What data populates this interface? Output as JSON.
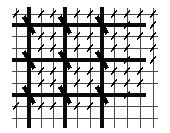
{
  "figure": {
    "width": 170,
    "height": 133,
    "background_color": "#ffffff",
    "thin_line_color": "#4a4a4a",
    "thick_line_color": "#0a0a0a",
    "marker_color": "#000000",
    "thin_line_width": 1,
    "thick_line_width": 3.2,
    "large_marker_width": 4.2,
    "small_marker_width": 1.6
  },
  "chart_data": {
    "type": "scatter",
    "title": "",
    "xlabel": "",
    "ylabel": "",
    "xlim": [
      0,
      170
    ],
    "ylim": [
      0,
      133
    ],
    "grid": true,
    "legend": null,
    "vertical_lines": [
      {
        "x": 16,
        "weight": "thin",
        "y0": 8,
        "y1": 128
      },
      {
        "x": 29,
        "weight": "thick",
        "y0": 7,
        "y1": 128
      },
      {
        "x": 41,
        "weight": "thin",
        "y0": 8,
        "y1": 128
      },
      {
        "x": 53,
        "weight": "thin",
        "y0": 8,
        "y1": 128
      },
      {
        "x": 65,
        "weight": "thick",
        "y0": 7,
        "y1": 128
      },
      {
        "x": 77,
        "weight": "thin",
        "y0": 8,
        "y1": 128
      },
      {
        "x": 90,
        "weight": "thin",
        "y0": 8,
        "y1": 128
      },
      {
        "x": 102,
        "weight": "thick",
        "y0": 7,
        "y1": 128
      },
      {
        "x": 114,
        "weight": "thin",
        "y0": 8,
        "y1": 128
      },
      {
        "x": 127,
        "weight": "thin",
        "y0": 8,
        "y1": 128
      },
      {
        "x": 140,
        "weight": "thin",
        "y0": 8,
        "y1": 128
      },
      {
        "x": 153,
        "weight": "thin",
        "y0": 8,
        "y1": 128
      }
    ],
    "horizontal_lines": [
      {
        "y": 14,
        "weight": "thin",
        "x0": 12,
        "x1": 158
      },
      {
        "y": 25,
        "weight": "thick",
        "x0": 12,
        "x1": 146
      },
      {
        "y": 36,
        "weight": "thin",
        "x0": 12,
        "x1": 158
      },
      {
        "y": 48,
        "weight": "thin",
        "x0": 12,
        "x1": 158
      },
      {
        "y": 60,
        "weight": "thick",
        "x0": 12,
        "x1": 146
      },
      {
        "y": 71,
        "weight": "thin",
        "x0": 12,
        "x1": 158
      },
      {
        "y": 83,
        "weight": "thin",
        "x0": 12,
        "x1": 158
      },
      {
        "y": 95,
        "weight": "thick",
        "x0": 12,
        "x1": 146
      },
      {
        "y": 106,
        "weight": "thin",
        "x0": 12,
        "x1": 158
      },
      {
        "y": 118,
        "weight": "thin",
        "x0": 12,
        "x1": 158
      }
    ],
    "large_markers": [
      {
        "x": 29,
        "y": 25
      },
      {
        "x": 65,
        "y": 25
      },
      {
        "x": 102,
        "y": 25
      },
      {
        "x": 29,
        "y": 60
      },
      {
        "x": 65,
        "y": 60
      },
      {
        "x": 102,
        "y": 60
      },
      {
        "x": 29,
        "y": 95
      },
      {
        "x": 65,
        "y": 95
      },
      {
        "x": 102,
        "y": 95
      }
    ],
    "small_markers": [
      {
        "x": 16,
        "y": 14
      },
      {
        "x": 41,
        "y": 14
      },
      {
        "x": 53,
        "y": 14
      },
      {
        "x": 77,
        "y": 14
      },
      {
        "x": 90,
        "y": 14
      },
      {
        "x": 114,
        "y": 14
      },
      {
        "x": 127,
        "y": 14
      },
      {
        "x": 140,
        "y": 14
      },
      {
        "x": 153,
        "y": 14
      },
      {
        "x": 127,
        "y": 25
      },
      {
        "x": 153,
        "y": 25
      },
      {
        "x": 41,
        "y": 36
      },
      {
        "x": 53,
        "y": 36
      },
      {
        "x": 77,
        "y": 36
      },
      {
        "x": 90,
        "y": 36
      },
      {
        "x": 114,
        "y": 36
      },
      {
        "x": 127,
        "y": 36
      },
      {
        "x": 140,
        "y": 36
      },
      {
        "x": 153,
        "y": 36
      },
      {
        "x": 41,
        "y": 48
      },
      {
        "x": 53,
        "y": 48
      },
      {
        "x": 77,
        "y": 48
      },
      {
        "x": 90,
        "y": 48
      },
      {
        "x": 114,
        "y": 48
      },
      {
        "x": 127,
        "y": 48
      },
      {
        "x": 153,
        "y": 48
      },
      {
        "x": 127,
        "y": 60
      },
      {
        "x": 153,
        "y": 60
      },
      {
        "x": 41,
        "y": 71
      },
      {
        "x": 53,
        "y": 71
      },
      {
        "x": 77,
        "y": 71
      },
      {
        "x": 90,
        "y": 71
      },
      {
        "x": 114,
        "y": 71
      },
      {
        "x": 127,
        "y": 71
      },
      {
        "x": 140,
        "y": 71
      },
      {
        "x": 41,
        "y": 83
      },
      {
        "x": 53,
        "y": 83
      },
      {
        "x": 77,
        "y": 83
      },
      {
        "x": 90,
        "y": 83
      },
      {
        "x": 114,
        "y": 83
      },
      {
        "x": 127,
        "y": 83
      },
      {
        "x": 140,
        "y": 83
      },
      {
        "x": 127,
        "y": 95
      },
      {
        "x": 16,
        "y": 106
      },
      {
        "x": 41,
        "y": 106
      },
      {
        "x": 53,
        "y": 106
      },
      {
        "x": 77,
        "y": 106
      },
      {
        "x": 90,
        "y": 106
      }
    ]
  }
}
